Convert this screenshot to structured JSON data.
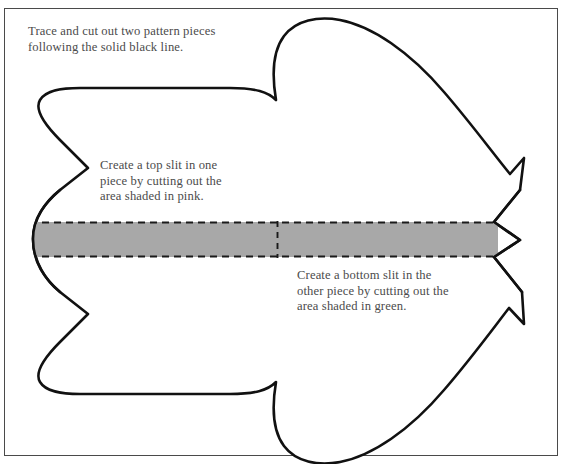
{
  "page": {
    "width": 565,
    "height": 464,
    "background": "#ffffff",
    "frame_color": "#4a4a4a"
  },
  "notes": {
    "intro": "Trace and cut out two pattern pieces\nfollowing the solid black line.",
    "top_slit": "Create a top slit in one\npiece by cutting out the\narea shaded in pink.",
    "bottom_slit": "Create a bottom slit in the\nother piece by cutting out the\narea shaded in green."
  },
  "pattern": {
    "outline_color": "#111111",
    "outline_width": 2.6,
    "fill": "#ffffff",
    "band": {
      "fill": "#a8a8a8",
      "dash_color": "#1a1a1a",
      "top_y": 222,
      "bottom_y": 257,
      "left_x": 33,
      "right_tip_x": 494,
      "divider_x": 277
    }
  }
}
